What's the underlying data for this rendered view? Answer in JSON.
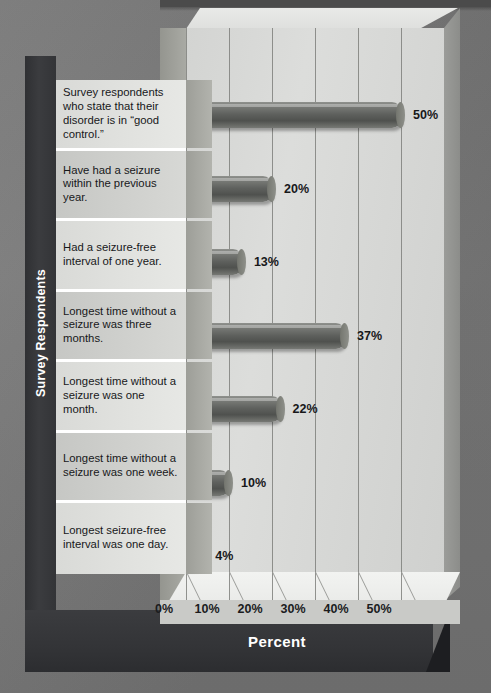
{
  "chart_data": {
    "type": "bar",
    "orientation": "horizontal",
    "title": "",
    "xlabel": "Percent",
    "ylabel": "Survey Respondents",
    "xlim": [
      0,
      60
    ],
    "xticks": [
      "0%",
      "10%",
      "20%",
      "30%",
      "40%",
      "50%"
    ],
    "xtick_values": [
      0,
      10,
      20,
      30,
      40,
      50
    ],
    "grid": true,
    "legend": "none",
    "categories": [
      "Survey respondents who state that their disorder is in “good control.”",
      "Have had a seizure within the previous year.",
      "Had a seizure-free interval of one year.",
      "Longest time without a seizure was three months.",
      "Longest time without a seizure was one month.",
      "Longest time without a seizure was one week.",
      "Longest seizure-free interval was one day."
    ],
    "values": [
      50,
      20,
      13,
      37,
      22,
      10,
      4
    ],
    "value_labels": [
      "50%",
      "20%",
      "13%",
      "37%",
      "22%",
      "10%",
      "4%"
    ],
    "colors": {
      "bar": "#5e605d",
      "plot_background": "#d8d9d7",
      "frame": "#35363a",
      "page_background": "#7b7b7b",
      "label_text": "#17181a",
      "axis_title_text": "#ffffff"
    }
  }
}
